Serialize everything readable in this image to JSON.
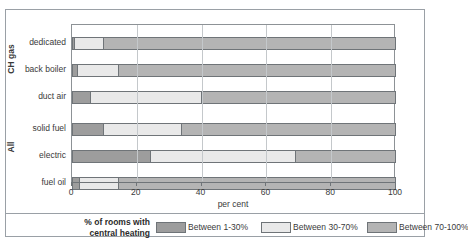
{
  "figure": {
    "title_remnant": "",
    "x_axis_title": "per cent"
  },
  "legend": {
    "title_line1": "% of rooms with",
    "title_line2": "central heating",
    "items": [
      {
        "label": "Between 1-30%",
        "color": "#9d9d9d"
      },
      {
        "label": "Between 30-70%",
        "color": "#e9e9e9"
      },
      {
        "label": "Between 70-100%",
        "color": "#b4b4b4"
      }
    ]
  },
  "groups": [
    {
      "name": "CH gas"
    },
    {
      "name": "All"
    }
  ],
  "chart_data": {
    "type": "bar",
    "orientation": "horizontal",
    "stacked": true,
    "title": "",
    "xlabel": "per cent",
    "ylabel": "",
    "xlim": [
      0,
      100
    ],
    "xticks": [
      0,
      20,
      40,
      60,
      80,
      100
    ],
    "grid": true,
    "legend_position": "bottom",
    "series": [
      {
        "name": "Between 1-30%",
        "color": "#9d9d9d",
        "values": [
          1,
          2,
          6,
          10,
          24.5,
          2.5
        ]
      },
      {
        "name": "Between 30-70%",
        "color": "#e9e9e9",
        "values": [
          9,
          12.5,
          34,
          24,
          44.5,
          12
        ]
      },
      {
        "name": "Between 70-100%",
        "color": "#b4b4b4",
        "values": [
          90,
          85.5,
          60,
          66,
          31,
          85.5
        ]
      }
    ],
    "categories": [
      "dedicated",
      "back boiler",
      "duct air",
      "solid fuel",
      "electric",
      "fuel oil"
    ],
    "category_groups": [
      {
        "label": "CH gas",
        "categories": [
          "dedicated",
          "back boiler",
          "duct air"
        ]
      },
      {
        "label": "All",
        "categories": [
          "solid fuel",
          "electric",
          "fuel oil"
        ]
      }
    ]
  }
}
